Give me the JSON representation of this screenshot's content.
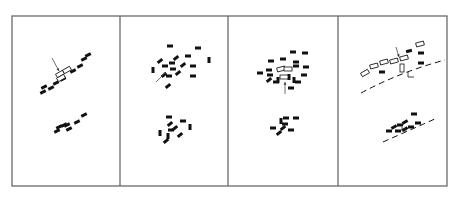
{
  "figure": {
    "frame": {
      "x": 12,
      "y": 16,
      "w": 435,
      "h": 170,
      "stroke": "#6a6a6a"
    },
    "dividers": [
      120,
      228,
      338
    ],
    "ink": "#111111",
    "panels": [
      {
        "id": "panel-1",
        "description": "linear cluster along a diagonal with outlined (highlighted) rectangles marked by arrow",
        "filled": [
          [
            44,
            87,
            -25
          ],
          [
            43,
            92,
            -25
          ],
          [
            51,
            88,
            -25
          ],
          [
            56,
            83,
            -25
          ],
          [
            63,
            79,
            -25
          ],
          [
            73,
            71,
            -25
          ],
          [
            80,
            66,
            -25
          ],
          [
            84,
            59,
            -25
          ],
          [
            88,
            55,
            -25
          ],
          [
            57,
            131,
            -25
          ],
          [
            59,
            127,
            -25
          ],
          [
            64,
            125,
            -25
          ],
          [
            67,
            125,
            -25
          ],
          [
            69,
            129,
            -25
          ],
          [
            77,
            122,
            -25
          ],
          [
            84,
            115,
            -25
          ]
        ],
        "outlined": [
          [
            60,
            74,
            -30
          ],
          [
            67,
            70,
            -30
          ],
          [
            61,
            78,
            -30
          ]
        ],
        "arrows": [
          [
            52,
            58,
            59,
            71
          ]
        ]
      },
      {
        "id": "panel-2",
        "description": "scattered cluster, arrow pointing into cluster",
        "filled": [
          [
            170,
            46,
            0
          ],
          [
            198,
            48,
            0
          ],
          [
            209,
            60,
            90
          ],
          [
            188,
            56,
            0
          ],
          [
            176,
            58,
            -40
          ],
          [
            160,
            61,
            -40
          ],
          [
            172,
            63,
            0
          ],
          [
            183,
            65,
            -40
          ],
          [
            193,
            66,
            0
          ],
          [
            153,
            70,
            90
          ],
          [
            165,
            66,
            0
          ],
          [
            173,
            69,
            0
          ],
          [
            178,
            73,
            -40
          ],
          [
            164,
            75,
            -40
          ],
          [
            169,
            76,
            0
          ],
          [
            193,
            76,
            0
          ],
          [
            168,
            86,
            -40
          ],
          [
            169,
            117,
            0
          ],
          [
            183,
            121,
            0
          ],
          [
            190,
            127,
            90
          ],
          [
            170,
            124,
            -40
          ],
          [
            171,
            130,
            0
          ],
          [
            175,
            128,
            -40
          ],
          [
            160,
            133,
            90
          ],
          [
            168,
            136,
            90
          ],
          [
            180,
            135,
            -40
          ],
          [
            166,
            141,
            -40
          ]
        ],
        "outlined": [],
        "arrows": [
          [
            156,
            82,
            166,
            72
          ]
        ]
      },
      {
        "id": "panel-3",
        "description": "scattered cluster with outlined rectangles, arrow from below",
        "filled": [
          [
            293,
            52,
            0
          ],
          [
            305,
            53,
            0
          ],
          [
            271,
            61,
            0
          ],
          [
            283,
            59,
            0
          ],
          [
            296,
            62,
            0
          ],
          [
            269,
            70,
            0
          ],
          [
            296,
            66,
            0
          ],
          [
            306,
            67,
            0
          ],
          [
            260,
            73,
            0
          ],
          [
            270,
            75,
            0
          ],
          [
            289,
            77,
            90
          ],
          [
            304,
            75,
            0
          ],
          [
            269,
            80,
            -40
          ],
          [
            278,
            80,
            90
          ],
          [
            294,
            80,
            90
          ],
          [
            298,
            82,
            0
          ],
          [
            276,
            82,
            0
          ],
          [
            291,
            88,
            0
          ],
          [
            286,
            118,
            0
          ],
          [
            296,
            118,
            0
          ],
          [
            281,
            121,
            90
          ],
          [
            285,
            124,
            0
          ],
          [
            273,
            128,
            0
          ],
          [
            283,
            128,
            -40
          ],
          [
            291,
            130,
            0
          ],
          [
            279,
            133,
            -40
          ]
        ],
        "outlined": [
          [
            281,
            69,
            -15
          ],
          [
            288,
            69,
            0
          ],
          [
            284,
            77,
            0
          ]
        ],
        "arrows": [
          [
            285,
            94,
            285,
            82
          ]
        ]
      },
      {
        "id": "panel-4",
        "description": "outlined rectangles along a dashed line (road), with filled blocks; second cluster near a dashed line",
        "filled": [
          [
            409,
            51,
            -15
          ],
          [
            421,
            53,
            0
          ],
          [
            421,
            63,
            0
          ],
          [
            382,
            72,
            0
          ],
          [
            414,
            114,
            0
          ],
          [
            394,
            127,
            -30
          ],
          [
            400,
            125,
            0
          ],
          [
            405,
            122,
            -30
          ],
          [
            405,
            129,
            -30
          ],
          [
            411,
            127,
            0
          ],
          [
            389,
            131,
            0
          ],
          [
            398,
            131,
            0
          ],
          [
            418,
            123,
            0
          ]
        ],
        "outlined": [
          [
            365,
            73,
            -30
          ],
          [
            374,
            66,
            -15
          ],
          [
            384,
            62,
            -15
          ],
          [
            394,
            61,
            -15
          ],
          [
            404,
            58,
            -15
          ],
          [
            420,
            44,
            -15
          ],
          [
            402,
            68,
            90
          ]
        ],
        "arrows": [
          [
            396,
            47,
            399,
            57
          ]
        ],
        "dashed_lines": [
          "M361,93 Q400,72 445,60",
          "M383,142 Q410,130 437,118"
        ],
        "ticks": [
          [
            408,
            72,
            408,
            77,
            414,
            77
          ],
          [
            402,
            127,
            402,
            131,
            407,
            131
          ]
        ]
      }
    ]
  }
}
